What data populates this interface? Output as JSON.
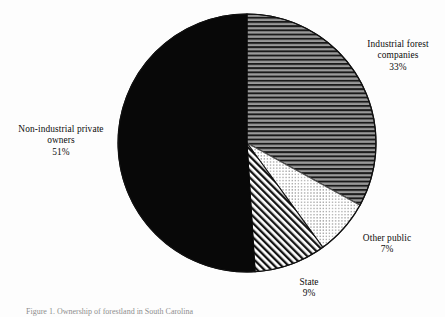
{
  "chart_data": {
    "type": "pie",
    "title": "",
    "subtitle": "",
    "xlabel": "",
    "ylabel": "",
    "legend_position": "callout-labels",
    "grid": false,
    "start_angle_deg": 0,
    "direction": "clockwise",
    "units": "percent",
    "categories": [
      "Industrial forest companies",
      "Other public",
      "State",
      "Non-industrial private owners"
    ],
    "values": [
      33,
      7,
      9,
      51
    ],
    "slices": [
      {
        "label": "Industrial forest companies",
        "label_line_1": "Industrial forest",
        "label_line_2": "companies",
        "value": 33,
        "value_text": "33%",
        "fill": "horizontal-lines",
        "fill_color": "#808080",
        "line_color": "#111111"
      },
      {
        "label": "Other public",
        "label_line_1": "Other public",
        "label_line_2": "",
        "value": 7,
        "value_text": "7%",
        "fill": "fine-stipple-dots",
        "fill_color": "#ffffff",
        "line_color": "#4d4d4d"
      },
      {
        "label": "State",
        "label_line_1": "State",
        "label_line_2": "",
        "value": 9,
        "value_text": "9%",
        "fill": "diagonal-hatch",
        "fill_color": "#ffffff",
        "line_color": "#111111"
      },
      {
        "label": "Non-industrial private owners",
        "label_line_1": "Non-industrial private",
        "label_line_2": "owners",
        "value": 51,
        "value_text": "51%",
        "fill": "solid",
        "fill_color": "#080808",
        "line_color": "#080808"
      }
    ]
  },
  "caption": {
    "text": "Figure 1. Ownership of forestland in South Carolina"
  },
  "colors": {
    "background": "#fdfdfd",
    "outline": "#111111",
    "text": "#0d0d0d"
  }
}
